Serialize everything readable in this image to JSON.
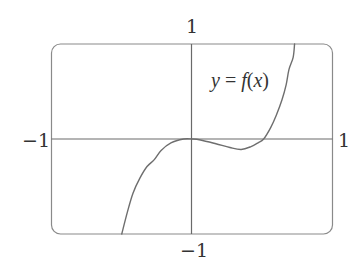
{
  "chart_data": {
    "type": "line",
    "title": "",
    "xlabel": "",
    "ylabel": "",
    "xlim": [
      -1,
      1
    ],
    "ylim": [
      -1,
      1
    ],
    "grid": false,
    "axes": {
      "x_axis_at": 0,
      "y_axis_at": 0,
      "frame": "rounded-rectangle"
    },
    "tick_labels": {
      "x_min": "−1",
      "x_max": "1",
      "y_max": "1",
      "y_min": "−1"
    },
    "annotations": [
      {
        "text": "y = f(x)",
        "x": 0.28,
        "y": 0.62
      }
    ],
    "series": [
      {
        "name": "y = f(x)",
        "color": "#6e6e6e",
        "points": [
          [
            -0.5,
            -1.0
          ],
          [
            -0.46,
            -0.77
          ],
          [
            -0.42,
            -0.57
          ],
          [
            -0.37,
            -0.41
          ],
          [
            -0.32,
            -0.29
          ],
          [
            -0.27,
            -0.22
          ],
          [
            -0.22,
            -0.12
          ],
          [
            -0.15,
            -0.04
          ],
          [
            -0.06,
            0.0
          ],
          [
            0.0,
            0.0
          ],
          [
            0.06,
            -0.01
          ],
          [
            0.17,
            -0.05
          ],
          [
            0.27,
            -0.09
          ],
          [
            0.35,
            -0.11
          ],
          [
            0.42,
            -0.08
          ],
          [
            0.47,
            -0.04
          ],
          [
            0.51,
            0.0
          ],
          [
            0.56,
            0.12
          ],
          [
            0.6,
            0.25
          ],
          [
            0.64,
            0.41
          ],
          [
            0.67,
            0.57
          ],
          [
            0.69,
            0.73
          ],
          [
            0.72,
            0.86
          ],
          [
            0.73,
            1.0
          ]
        ]
      }
    ],
    "features": {
      "local_max": [
        0,
        0
      ],
      "local_min": [
        0.35,
        -0.11
      ],
      "roots": [
        0,
        0.51
      ]
    }
  },
  "labels": {
    "x_min": "−1",
    "x_max": "1",
    "y_max": "1",
    "y_min": "−1",
    "curve_y": "y",
    "curve_eq": " = ",
    "curve_f": "f",
    "curve_open": "(",
    "curve_x": "x",
    "curve_close": ")"
  },
  "colors": {
    "frame": "#8a8a8a",
    "axes": "#6a6a6a",
    "curve": "#6e6e6e",
    "text": "#333333"
  }
}
